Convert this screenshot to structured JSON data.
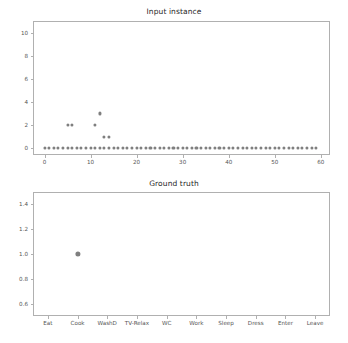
{
  "figure": {
    "width": 348,
    "height": 343,
    "background": "#ffffff",
    "marker_color": "#7f7f7f",
    "axis_color": "#b0b0b0",
    "text_color": "#555555",
    "title_color": "#262626"
  },
  "chart_data": [
    {
      "type": "scatter",
      "title": "Input instance",
      "xlabel": "",
      "ylabel": "",
      "xlim": [
        -2.5,
        62
      ],
      "ylim": [
        -0.6,
        11.0
      ],
      "grid": false,
      "legend": null,
      "xticks": [
        0,
        10,
        20,
        30,
        40,
        50,
        60
      ],
      "xticklabels": [
        "0",
        "10",
        "20",
        "30",
        "40",
        "50",
        "60"
      ],
      "yticks": [
        0,
        2,
        4,
        6,
        8,
        10
      ],
      "yticklabels": [
        "0",
        "2",
        "4",
        "6",
        "8",
        "10"
      ],
      "series": [
        {
          "name": "input",
          "marker": "o",
          "color": "#7f7f7f",
          "x": [
            0,
            1,
            2,
            3,
            4,
            5,
            6,
            7,
            8,
            9,
            10,
            11,
            12,
            13,
            14,
            15,
            16,
            17,
            18,
            19,
            20,
            21,
            22,
            23,
            24,
            25,
            26,
            27,
            28,
            29,
            30,
            31,
            32,
            33,
            34,
            35,
            36,
            37,
            38,
            39,
            40,
            41,
            42,
            43,
            44,
            45,
            46,
            47,
            48,
            49,
            50,
            51,
            52,
            53,
            54,
            55,
            56,
            57,
            58,
            59,
            5,
            6,
            11,
            12,
            13,
            14
          ],
          "y": [
            0,
            0,
            0,
            0,
            0,
            0,
            0,
            0,
            0,
            0,
            0,
            0,
            0,
            0,
            0,
            0,
            0,
            0,
            0,
            0,
            0,
            0,
            0,
            0,
            0,
            0,
            0,
            0,
            0,
            0,
            0,
            0,
            0,
            0,
            0,
            0,
            0,
            0,
            0,
            0,
            0,
            0,
            0,
            0,
            0,
            0,
            0,
            0,
            0,
            0,
            0,
            0,
            0,
            0,
            0,
            0,
            0,
            0,
            0,
            0,
            2,
            2,
            2,
            3,
            1,
            1
          ]
        }
      ],
      "annotations": [
        {
          "text": "elevated points at x=5,6 -> y=2"
        },
        {
          "text": "elevated point at x=11 -> y=2"
        },
        {
          "text": "elevated point at x=12 -> y=3"
        },
        {
          "text": "elevated points at x=13,14 -> y=1"
        }
      ]
    },
    {
      "type": "scatter",
      "title": "Ground truth",
      "xlabel": "",
      "ylabel": "",
      "xlim": [
        -0.5,
        9.5
      ],
      "ylim": [
        0.5,
        1.5
      ],
      "grid": false,
      "legend": null,
      "categories": [
        "Eat",
        "Cook",
        "WashD",
        "TV-Relax",
        "WC",
        "Work",
        "Sleep",
        "Dress",
        "Enter",
        "Leave"
      ],
      "xticks": [
        0,
        1,
        2,
        3,
        4,
        5,
        6,
        7,
        8,
        9
      ],
      "xticklabels": [
        "Eat",
        "Cook",
        "WashD",
        "TV-Relax",
        "WC",
        "Work",
        "Sleep",
        "Dress",
        "Enter",
        "Leave"
      ],
      "yticks": [
        0.6,
        0.8,
        1.0,
        1.2,
        1.4
      ],
      "yticklabels": [
        "0.6",
        "0.8",
        "1.0",
        "1.2",
        "1.4"
      ],
      "series": [
        {
          "name": "ground truth",
          "marker": "o",
          "color": "#7f7f7f",
          "x": [
            1
          ],
          "y": [
            1.0
          ]
        }
      ]
    }
  ]
}
